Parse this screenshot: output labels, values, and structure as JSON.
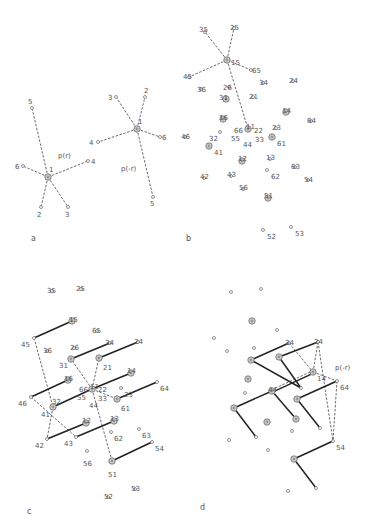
{
  "panels": {
    "a": {
      "label": "a",
      "stars": [
        {
          "center": {
            "id": "1",
            "x": 48,
            "y": 177
          },
          "func_label": "p(r)",
          "func_label_pos": [
            58,
            158
          ],
          "points": [
            {
              "id": "5",
              "x": 32,
              "y": 108,
              "lx": 28,
              "ly": 104
            },
            {
              "id": "6",
              "x": 23,
              "y": 166,
              "lx": 15,
              "ly": 169
            },
            {
              "id": "4",
              "x": 88,
              "y": 161,
              "lx": 91,
              "ly": 164
            },
            {
              "id": "2",
              "x": 41,
              "y": 207,
              "lx": 37,
              "ly": 217
            },
            {
              "id": "3",
              "x": 68,
              "y": 207,
              "lx": 65,
              "ly": 217
            }
          ]
        },
        {
          "center": {
            "id": "1",
            "x": 137,
            "y": 129
          },
          "func_label": "p(-r)",
          "func_label_pos": [
            121,
            171
          ],
          "points": [
            {
              "id": "3",
              "x": 116,
              "y": 97,
              "lx": 108,
              "ly": 100
            },
            {
              "id": "2",
              "x": 145,
              "y": 97,
              "lx": 144,
              "ly": 93
            },
            {
              "id": "4",
              "x": 98,
              "y": 142,
              "lx": 89,
              "ly": 145
            },
            {
              "id": "6",
              "x": 160,
              "y": 137,
              "lx": 162,
              "ly": 140
            },
            {
              "id": "5",
              "x": 153,
              "y": 197,
              "lx": 150,
              "ly": 206
            }
          ]
        }
      ]
    },
    "b": {
      "label": "b",
      "center": "15",
      "spokes": [
        "35",
        "25",
        "45",
        "65",
        "11"
      ],
      "points": [
        {
          "id": "35",
          "x": 205,
          "y": 32,
          "big": false,
          "lx": 199,
          "ly": 26
        },
        {
          "id": "25",
          "x": 234,
          "y": 28,
          "big": false,
          "lx": 230,
          "ly": 24
        },
        {
          "id": "15",
          "x": 227,
          "y": 60,
          "big": true,
          "lx": 231,
          "ly": 59
        },
        {
          "id": "65",
          "x": 251,
          "y": 70,
          "big": false,
          "lx": 252,
          "ly": 67
        },
        {
          "id": "45",
          "x": 189,
          "y": 77,
          "big": false,
          "lx": 183,
          "ly": 73
        },
        {
          "id": "36",
          "x": 201,
          "y": 89,
          "big": false,
          "lx": 197,
          "ly": 86
        },
        {
          "id": "26",
          "x": 229,
          "y": 87,
          "big": false,
          "lx": 223,
          "ly": 84
        },
        {
          "id": "34",
          "x": 263,
          "y": 83,
          "big": false,
          "lx": 259,
          "ly": 79
        },
        {
          "id": "24",
          "x": 293,
          "y": 81,
          "big": false,
          "lx": 289,
          "ly": 77
        },
        {
          "id": "31",
          "x": 226,
          "y": 99,
          "big": true,
          "lx": 219,
          "ly": 94
        },
        {
          "id": "21",
          "x": 253,
          "y": 97,
          "big": false,
          "lx": 249,
          "ly": 93
        },
        {
          "id": "14",
          "x": 286,
          "y": 112,
          "big": true,
          "lx": 282,
          "ly": 107
        },
        {
          "id": "16",
          "x": 223,
          "y": 119,
          "big": true,
          "lx": 219,
          "ly": 114
        },
        {
          "id": "64",
          "x": 311,
          "y": 121,
          "big": false,
          "lx": 307,
          "ly": 117
        },
        {
          "id": "11",
          "x": 248,
          "y": 129,
          "big": true,
          "lx": 246,
          "ly": 123
        },
        {
          "id": "66",
          "x": 248,
          "y": 129,
          "big": true,
          "lx": 234,
          "ly": 127,
          "label_only": true
        },
        {
          "id": "22",
          "x": 248,
          "y": 129,
          "big": true,
          "lx": 254,
          "ly": 127,
          "label_only": true
        },
        {
          "id": "33",
          "x": 248,
          "y": 129,
          "big": true,
          "lx": 255,
          "ly": 136,
          "label_only": true
        },
        {
          "id": "55",
          "x": 248,
          "y": 129,
          "big": true,
          "lx": 231,
          "ly": 135,
          "label_only": true
        },
        {
          "id": "44",
          "x": 248,
          "y": 129,
          "big": true,
          "lx": 243,
          "ly": 141,
          "label_only": true
        },
        {
          "id": "23",
          "x": 276,
          "y": 128,
          "big": false,
          "lx": 272,
          "ly": 124
        },
        {
          "id": "46",
          "x": 185,
          "y": 137,
          "big": false,
          "lx": 181,
          "ly": 133
        },
        {
          "id": "32",
          "x": 220,
          "y": 132,
          "big": false,
          "lx": 209,
          "ly": 135
        },
        {
          "id": "61",
          "x": 272,
          "y": 137,
          "big": true,
          "lx": 277,
          "ly": 140
        },
        {
          "id": "41",
          "x": 209,
          "y": 146,
          "big": true,
          "lx": 214,
          "ly": 149
        },
        {
          "id": "12",
          "x": 242,
          "y": 161,
          "big": true,
          "lx": 238,
          "ly": 155
        },
        {
          "id": "13",
          "x": 270,
          "y": 159,
          "big": false,
          "lx": 266,
          "ly": 154
        },
        {
          "id": "63",
          "x": 295,
          "y": 167,
          "big": false,
          "lx": 291,
          "ly": 163
        },
        {
          "id": "42",
          "x": 204,
          "y": 178,
          "big": false,
          "lx": 200,
          "ly": 173
        },
        {
          "id": "43",
          "x": 231,
          "y": 176,
          "big": false,
          "lx": 227,
          "ly": 171
        },
        {
          "id": "62",
          "x": 267,
          "y": 170,
          "big": false,
          "lx": 271,
          "ly": 173
        },
        {
          "id": "54",
          "x": 308,
          "y": 180,
          "big": false,
          "lx": 304,
          "ly": 176
        },
        {
          "id": "56",
          "x": 243,
          "y": 189,
          "big": false,
          "lx": 239,
          "ly": 184
        },
        {
          "id": "51",
          "x": 268,
          "y": 198,
          "big": true,
          "lx": 264,
          "ly": 192
        },
        {
          "id": "52",
          "x": 263,
          "y": 230,
          "big": false,
          "lx": 267,
          "ly": 233
        },
        {
          "id": "53",
          "x": 291,
          "y": 227,
          "big": false,
          "lx": 295,
          "ly": 230
        }
      ]
    },
    "c": {
      "label": "c",
      "solid_links": [
        [
          "45",
          "15"
        ],
        [
          "31",
          "34"
        ],
        [
          "21",
          "24"
        ],
        [
          "11",
          "14"
        ],
        [
          "46",
          "16"
        ],
        [
          "41",
          "11"
        ],
        [
          "61",
          "64"
        ],
        [
          "42",
          "12"
        ],
        [
          "43",
          "13"
        ],
        [
          "51",
          "54"
        ]
      ],
      "dashed_links": [
        [
          "45",
          "41"
        ],
        [
          "41",
          "42"
        ],
        [
          "46",
          "43"
        ],
        [
          "11",
          "31"
        ],
        [
          "11",
          "21"
        ],
        [
          "11",
          "61"
        ],
        [
          "11",
          "51"
        ]
      ],
      "points": [
        {
          "id": "35",
          "x": 52,
          "y": 291,
          "big": false,
          "lx": 47,
          "ly": 287
        },
        {
          "id": "25",
          "x": 81,
          "y": 289,
          "big": false,
          "lx": 76,
          "ly": 285
        },
        {
          "id": "15",
          "x": 72,
          "y": 321,
          "big": true,
          "lx": 69,
          "ly": 316
        },
        {
          "id": "65",
          "x": 97,
          "y": 331,
          "big": false,
          "lx": 92,
          "ly": 327
        },
        {
          "id": "45",
          "x": 34,
          "y": 338,
          "big": false,
          "lx": 21,
          "ly": 341
        },
        {
          "id": "36",
          "x": 47,
          "y": 351,
          "big": false,
          "lx": 43,
          "ly": 347
        },
        {
          "id": "26",
          "x": 74,
          "y": 348,
          "big": false,
          "lx": 70,
          "ly": 344
        },
        {
          "id": "34",
          "x": 110,
          "y": 343,
          "big": false,
          "lx": 105,
          "ly": 339
        },
        {
          "id": "24",
          "x": 138,
          "y": 342,
          "big": false,
          "lx": 134,
          "ly": 338
        },
        {
          "id": "31",
          "x": 71,
          "y": 359,
          "big": true,
          "lx": 59,
          "ly": 362
        },
        {
          "id": "21",
          "x": 99,
          "y": 358,
          "big": true,
          "lx": 103,
          "ly": 364
        },
        {
          "id": "14",
          "x": 131,
          "y": 373,
          "big": true,
          "lx": 127,
          "ly": 367
        },
        {
          "id": "16",
          "x": 68,
          "y": 380,
          "big": true,
          "lx": 64,
          "ly": 375
        },
        {
          "id": "64",
          "x": 157,
          "y": 382,
          "big": false,
          "lx": 160,
          "ly": 385
        },
        {
          "id": "11",
          "x": 92,
          "y": 389,
          "big": true,
          "lx": 90,
          "ly": 383
        },
        {
          "id": "66",
          "x": 92,
          "y": 389,
          "big": true,
          "lx": 79,
          "ly": 386,
          "label_only": true
        },
        {
          "id": "22",
          "x": 92,
          "y": 389,
          "big": true,
          "lx": 98,
          "ly": 386,
          "label_only": true
        },
        {
          "id": "33",
          "x": 92,
          "y": 389,
          "big": true,
          "lx": 98,
          "ly": 395,
          "label_only": true
        },
        {
          "id": "55",
          "x": 92,
          "y": 389,
          "big": true,
          "lx": 77,
          "ly": 394,
          "label_only": true
        },
        {
          "id": "44",
          "x": 92,
          "y": 389,
          "big": true,
          "lx": 89,
          "ly": 402,
          "label_only": true
        },
        {
          "id": "23",
          "x": 121,
          "y": 388,
          "big": false,
          "lx": 124,
          "ly": 391
        },
        {
          "id": "46",
          "x": 31,
          "y": 397,
          "big": false,
          "lx": 18,
          "ly": 400
        },
        {
          "id": "32",
          "x": 53,
          "y": 407,
          "big": false,
          "lx": 52,
          "ly": 398,
          "label_only": true
        },
        {
          "id": "61",
          "x": 117,
          "y": 399,
          "big": true,
          "lx": 121,
          "ly": 405
        },
        {
          "id": "41",
          "x": 53,
          "y": 407,
          "big": true,
          "lx": 41,
          "ly": 411
        },
        {
          "id": "12",
          "x": 86,
          "y": 423,
          "big": true,
          "lx": 82,
          "ly": 417
        },
        {
          "id": "13",
          "x": 114,
          "y": 421,
          "big": true,
          "lx": 110,
          "ly": 415
        },
        {
          "id": "62",
          "x": 111,
          "y": 432,
          "big": false,
          "lx": 114,
          "ly": 435
        },
        {
          "id": "63",
          "x": 139,
          "y": 429,
          "big": false,
          "lx": 142,
          "ly": 432
        },
        {
          "id": "42",
          "x": 47,
          "y": 439,
          "big": false,
          "lx": 35,
          "ly": 442
        },
        {
          "id": "43",
          "x": 76,
          "y": 437,
          "big": false,
          "lx": 64,
          "ly": 440
        },
        {
          "id": "54",
          "x": 152,
          "y": 442,
          "big": false,
          "lx": 155,
          "ly": 445
        },
        {
          "id": "56",
          "x": 87,
          "y": 451,
          "big": false,
          "lx": 83,
          "ly": 460
        },
        {
          "id": "51",
          "x": 112,
          "y": 461,
          "big": true,
          "lx": 108,
          "ly": 471
        },
        {
          "id": "52",
          "x": 108,
          "y": 497,
          "big": false,
          "lx": 104,
          "ly": 493
        },
        {
          "id": "53",
          "x": 135,
          "y": 489,
          "big": false,
          "lx": 131,
          "ly": 485
        }
      ]
    },
    "d": {
      "label": "d",
      "func_label": "p(-r)",
      "func_label_pos": [
        335,
        370
      ],
      "labels": [
        {
          "id": "34",
          "lx": 285,
          "ly": 339
        },
        {
          "id": "24",
          "lx": 314,
          "ly": 338
        },
        {
          "id": "14",
          "lx": 317,
          "ly": 375
        },
        {
          "id": "64",
          "lx": 340,
          "ly": 384
        },
        {
          "id": "44",
          "lx": 268,
          "ly": 386
        },
        {
          "id": "54",
          "lx": 336,
          "ly": 444
        }
      ],
      "points": [
        {
          "x": 231,
          "y": 292,
          "big": false
        },
        {
          "x": 261,
          "y": 289,
          "big": false
        },
        {
          "x": 252,
          "y": 321,
          "big": true
        },
        {
          "x": 277,
          "y": 330,
          "big": false
        },
        {
          "x": 214,
          "y": 338,
          "big": false
        },
        {
          "x": 227,
          "y": 351,
          "big": false
        },
        {
          "x": 254,
          "y": 348,
          "big": false
        },
        {
          "x": 289,
          "y": 343,
          "big": false
        },
        {
          "x": 318,
          "y": 342,
          "big": false
        },
        {
          "x": 251,
          "y": 360,
          "big": true
        },
        {
          "x": 279,
          "y": 357,
          "big": true
        },
        {
          "x": 313,
          "y": 372,
          "big": true
        },
        {
          "x": 337,
          "y": 381,
          "big": false
        },
        {
          "x": 248,
          "y": 379,
          "big": true
        },
        {
          "x": 272,
          "y": 391,
          "big": true
        },
        {
          "x": 301,
          "y": 388,
          "big": false
        },
        {
          "x": 245,
          "y": 393,
          "big": false
        },
        {
          "x": 297,
          "y": 399,
          "big": true
        },
        {
          "x": 234,
          "y": 408,
          "big": true
        },
        {
          "x": 267,
          "y": 422,
          "big": true
        },
        {
          "x": 296,
          "y": 419,
          "big": true
        },
        {
          "x": 256,
          "y": 437,
          "big": false
        },
        {
          "x": 292,
          "y": 431,
          "big": false
        },
        {
          "x": 320,
          "y": 428,
          "big": false
        },
        {
          "x": 229,
          "y": 440,
          "big": false
        },
        {
          "x": 333,
          "y": 441,
          "big": false
        },
        {
          "x": 268,
          "y": 450,
          "big": false
        },
        {
          "x": 294,
          "y": 459,
          "big": true
        },
        {
          "x": 288,
          "y": 491,
          "big": false
        },
        {
          "x": 316,
          "y": 488,
          "big": false
        }
      ],
      "solid_links": [
        [
          [
            251,
            360
          ],
          [
            289,
            343
          ]
        ],
        [
          [
            279,
            357
          ],
          [
            318,
            342
          ]
        ],
        [
          [
            251,
            360
          ],
          [
            301,
            388
          ]
        ],
        [
          [
            279,
            357
          ],
          [
            301,
            388
          ]
        ],
        [
          [
            272,
            391
          ],
          [
            296,
            419
          ]
        ],
        [
          [
            272,
            391
          ],
          [
            234,
            408
          ]
        ],
        [
          [
            234,
            408
          ],
          [
            256,
            437
          ]
        ],
        [
          [
            297,
            399
          ],
          [
            337,
            381
          ]
        ],
        [
          [
            297,
            399
          ],
          [
            320,
            428
          ]
        ],
        [
          [
            294,
            459
          ],
          [
            333,
            441
          ]
        ],
        [
          [
            294,
            459
          ],
          [
            316,
            488
          ]
        ]
      ],
      "double_links": [
        [
          [
            272,
            391
          ],
          [
            313,
            372
          ]
        ]
      ],
      "dashed_links": [
        [
          [
            289,
            343
          ],
          [
            313,
            372
          ]
        ],
        [
          [
            318,
            342
          ],
          [
            313,
            372
          ]
        ],
        [
          [
            313,
            372
          ],
          [
            337,
            381
          ]
        ],
        [
          [
            318,
            342
          ],
          [
            333,
            441
          ]
        ],
        [
          [
            337,
            381
          ],
          [
            333,
            441
          ]
        ]
      ]
    }
  }
}
